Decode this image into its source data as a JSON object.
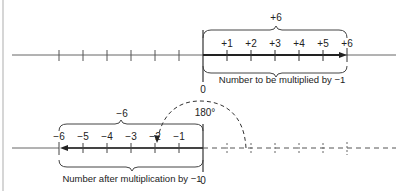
{
  "diagram": {
    "top_line": {
      "brace_label": "+6",
      "tick_labels": [
        "+1",
        "+2",
        "+3",
        "+4",
        "+5",
        "+6"
      ],
      "zero_label": "0",
      "caption": "Number to be multiplied by −1"
    },
    "rotation": {
      "angle_label": "180°"
    },
    "bottom_line": {
      "brace_label": "−6",
      "tick_labels": [
        "−6",
        "−5",
        "−4",
        "−3",
        "−2",
        "−1"
      ],
      "zero_label": "0",
      "caption": "Number after multiplication by −1"
    },
    "colors": {
      "line": "#555555",
      "bold_arrow": "#333333",
      "text": "#222222",
      "border": "#bbbbbb"
    }
  }
}
